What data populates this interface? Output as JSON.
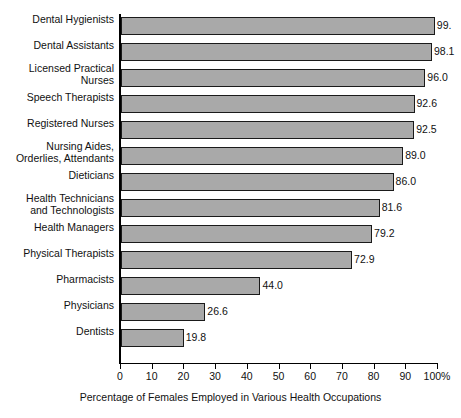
{
  "chart_data": {
    "type": "bar",
    "orientation": "horizontal",
    "title": "",
    "xlabel": "Percentage of Females Employed in Various Health Occupations",
    "ylabel": "",
    "xlim": [
      0,
      100
    ],
    "grid": false,
    "legend": "none",
    "xticks": [
      "0",
      "10",
      "20",
      "30",
      "40",
      "50",
      "60",
      "70",
      "80",
      "90",
      "100%"
    ],
    "xtick_values": [
      0,
      10,
      20,
      30,
      40,
      50,
      60,
      70,
      80,
      90,
      100
    ],
    "categories": [
      "Dental Hygienists",
      "Dental Assistants",
      "Licensed Practical\nNurses",
      "Speech Therapists",
      "Registered Nurses",
      "Nursing Aides,\nOrderlies, Attendants",
      "Dieticians",
      "Health Technicians\nand Technologists",
      "Health Managers",
      "Physical Therapists",
      "Pharmacists",
      "Physicians",
      "Dentists"
    ],
    "values": [
      99.0,
      98.1,
      96.0,
      92.6,
      92.5,
      89.0,
      86.0,
      81.6,
      79.2,
      72.9,
      44.0,
      26.6,
      19.8
    ],
    "value_labels": [
      "99.",
      "98.1",
      "96.0",
      "92.6",
      "92.5",
      "89.0",
      "86.0",
      "81.6",
      "79.2",
      "72.9",
      "44.0",
      "26.6",
      "19.8"
    ],
    "bar_fill_color": "#a9a9a9",
    "bar_border_color": "#1a1a1a",
    "background_color": "#ffffff"
  }
}
